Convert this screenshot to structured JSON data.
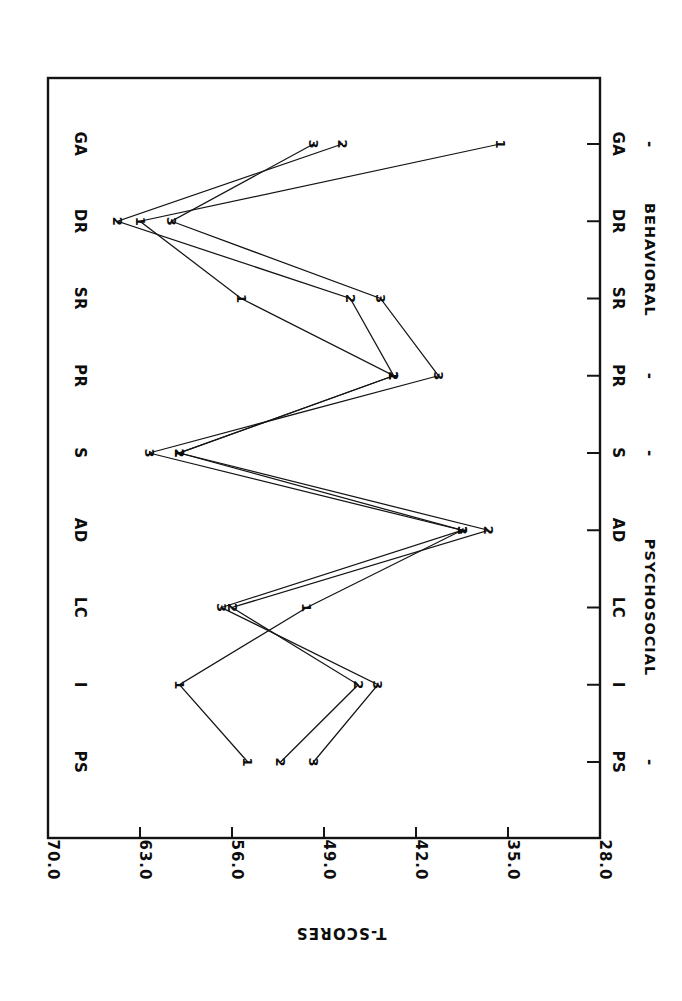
{
  "chart_data": {
    "type": "line",
    "title": "",
    "orientation": "rotated-90-ccw",
    "xlabel": "",
    "ylabel": "T-SCORES",
    "categories": [
      "PS",
      "I",
      "LC",
      "AD",
      "S",
      "PR",
      "SR",
      "DR",
      "GA"
    ],
    "category_groups": [
      {
        "label": "PSYCHOSOCIAL",
        "categories": [
          "PS",
          "I",
          "LC",
          "AD",
          "S"
        ]
      },
      {
        "label": "BEHAVIORAL",
        "categories": [
          "PR",
          "SR",
          "DR",
          "GA"
        ]
      }
    ],
    "group_separator": "-",
    "ylim": [
      28.0,
      70.0
    ],
    "ytick_labels": [
      "70.0",
      "63.0",
      "56.0",
      "49.0",
      "42.0",
      "35.0",
      "28.0"
    ],
    "ytick_values": [
      70.0,
      63.0,
      56.0,
      49.0,
      42.0,
      35.0,
      28.0
    ],
    "grid": false,
    "legend": "none",
    "marker_style": "series-number-digit",
    "series": [
      {
        "name": "1",
        "marker": "1",
        "values": [
          54.8,
          60.0,
          50.3,
          38.5,
          60.0,
          43.7,
          55.3,
          63.0,
          35.6
        ]
      },
      {
        "name": "2",
        "marker": "2",
        "values": [
          52.3,
          46.4,
          56.0,
          36.5,
          60.0,
          43.7,
          47.0,
          64.7,
          47.6
        ]
      },
      {
        "name": "3",
        "marker": "3",
        "values": [
          49.8,
          44.9,
          56.8,
          38.5,
          62.3,
          40.3,
          44.7,
          60.6,
          49.8
        ]
      }
    ]
  },
  "figure": {
    "frame": {
      "present": true,
      "color": "#141414"
    },
    "axis_title_text": "T-SCORES"
  }
}
